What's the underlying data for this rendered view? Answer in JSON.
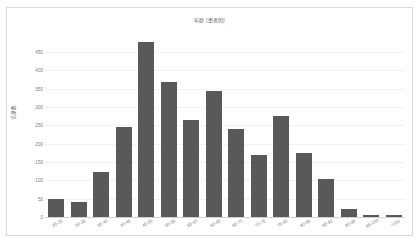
{
  "chart_data": {
    "type": "bar",
    "title": "年龄 (患者的)",
    "xlabel": "",
    "ylabel": "记录数",
    "categories": [
      "25-30",
      "30-35",
      "35-40",
      "40-45",
      "45-50",
      "50-55",
      "55-60",
      "60-65",
      "65-70",
      "70-75",
      "75-80",
      "80-85",
      "85-90",
      "90-95",
      "95-100",
      ">100"
    ],
    "values": [
      50,
      42,
      122,
      246,
      478,
      368,
      265,
      344,
      240,
      170,
      275,
      175,
      105,
      22,
      5,
      5
    ],
    "ylim": [
      0,
      450
    ],
    "yticks": [
      "450",
      "400",
      "350",
      "300",
      "250",
      "200",
      "150",
      "100",
      "50",
      "0"
    ],
    "ytick_values": [
      450,
      400,
      350,
      300,
      250,
      200,
      150,
      100,
      50,
      0
    ],
    "grid": true,
    "legend": "none",
    "bar_color": "#595959",
    "grid_color": "#f1f1f1",
    "axis_color": "#d0d0d0",
    "text_color": "#7a7a7a",
    "title_color": "#5a5a5a",
    "background": "#ffffff",
    "border_color": "#d8d8d8"
  }
}
